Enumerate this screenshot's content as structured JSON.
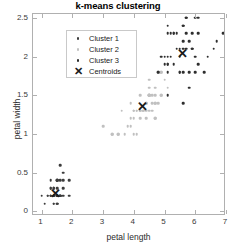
{
  "chart_data": {
    "type": "scatter",
    "title": "k-means clustering",
    "xlabel": "petal length",
    "ylabel": "petal width",
    "xlim": [
      0.72,
      7.0
    ],
    "ylim": [
      -0.06,
      2.55
    ],
    "xticks": [
      "1",
      "2",
      "3",
      "4",
      "5",
      "6",
      "7"
    ],
    "xtickvals": [
      1,
      2,
      3,
      4,
      5,
      6,
      7
    ],
    "yticks": [
      "0",
      "0.5",
      "1",
      "1.5",
      "2",
      "2.5"
    ],
    "ytickvals": [
      0,
      0.5,
      1,
      1.5,
      2,
      2.5
    ],
    "grid": false,
    "legend_position": "upper-left",
    "legend": [
      {
        "label": "Cluster 1",
        "marker": "dot",
        "color": "#3c3c3c"
      },
      {
        "label": "Cluster 2",
        "marker": "dot",
        "color": "#c0c0c0"
      },
      {
        "label": "Cluster 3",
        "marker": "dot",
        "color": "#2e2e2e"
      },
      {
        "label": "Centroids",
        "marker": "x",
        "color": "#1a1a1a"
      }
    ],
    "series": [
      {
        "name": "Cluster 1",
        "color": "#3c3c3c",
        "points": [
          [
            1.4,
            0.2
          ],
          [
            1.4,
            0.2
          ],
          [
            1.3,
            0.2
          ],
          [
            1.5,
            0.2
          ],
          [
            1.4,
            0.2
          ],
          [
            1.7,
            0.4
          ],
          [
            1.4,
            0.3
          ],
          [
            1.5,
            0.2
          ],
          [
            1.4,
            0.2
          ],
          [
            1.5,
            0.1
          ],
          [
            1.5,
            0.2
          ],
          [
            1.6,
            0.2
          ],
          [
            1.4,
            0.1
          ],
          [
            1.1,
            0.1
          ],
          [
            1.2,
            0.2
          ],
          [
            1.5,
            0.4
          ],
          [
            1.3,
            0.4
          ],
          [
            1.4,
            0.3
          ],
          [
            1.7,
            0.3
          ],
          [
            1.5,
            0.3
          ],
          [
            1.7,
            0.2
          ],
          [
            1.5,
            0.4
          ],
          [
            1.0,
            0.2
          ],
          [
            1.7,
            0.5
          ],
          [
            1.9,
            0.2
          ],
          [
            1.6,
            0.2
          ],
          [
            1.6,
            0.4
          ],
          [
            1.5,
            0.2
          ],
          [
            1.4,
            0.2
          ],
          [
            1.6,
            0.2
          ],
          [
            1.6,
            0.2
          ],
          [
            1.5,
            0.4
          ],
          [
            1.5,
            0.1
          ],
          [
            1.4,
            0.2
          ],
          [
            1.5,
            0.2
          ],
          [
            1.2,
            0.2
          ],
          [
            1.3,
            0.2
          ],
          [
            1.4,
            0.1
          ],
          [
            1.3,
            0.2
          ],
          [
            1.5,
            0.2
          ],
          [
            1.3,
            0.3
          ],
          [
            1.3,
            0.3
          ],
          [
            1.3,
            0.2
          ],
          [
            1.6,
            0.6
          ],
          [
            1.9,
            0.4
          ],
          [
            1.4,
            0.3
          ],
          [
            1.6,
            0.2
          ],
          [
            1.4,
            0.2
          ],
          [
            1.5,
            0.2
          ],
          [
            1.4,
            0.2
          ]
        ]
      },
      {
        "name": "Cluster 2",
        "color": "#c0c0c0",
        "points": [
          [
            4.7,
            1.4
          ],
          [
            4.5,
            1.5
          ],
          [
            4.9,
            1.5
          ],
          [
            4.0,
            1.3
          ],
          [
            4.6,
            1.5
          ],
          [
            4.5,
            1.3
          ],
          [
            4.7,
            1.6
          ],
          [
            3.3,
            1.0
          ],
          [
            4.6,
            1.3
          ],
          [
            3.9,
            1.4
          ],
          [
            3.5,
            1.0
          ],
          [
            4.2,
            1.5
          ],
          [
            4.0,
            1.0
          ],
          [
            4.7,
            1.4
          ],
          [
            3.6,
            1.3
          ],
          [
            4.4,
            1.4
          ],
          [
            4.5,
            1.5
          ],
          [
            4.1,
            1.0
          ],
          [
            4.5,
            1.5
          ],
          [
            3.9,
            1.1
          ],
          [
            4.8,
            1.8
          ],
          [
            4.0,
            1.3
          ],
          [
            4.9,
            1.5
          ],
          [
            4.7,
            1.2
          ],
          [
            4.3,
            1.3
          ],
          [
            4.4,
            1.4
          ],
          [
            4.8,
            1.4
          ],
          [
            5.0,
            1.7
          ],
          [
            4.5,
            1.5
          ],
          [
            3.5,
            1.0
          ],
          [
            3.8,
            1.1
          ],
          [
            3.7,
            1.0
          ],
          [
            3.9,
            1.2
          ],
          [
            5.1,
            1.6
          ],
          [
            4.5,
            1.5
          ],
          [
            4.5,
            1.6
          ],
          [
            4.7,
            1.5
          ],
          [
            4.4,
            1.3
          ],
          [
            4.1,
            1.3
          ],
          [
            4.0,
            1.3
          ],
          [
            4.4,
            1.2
          ],
          [
            4.6,
            1.4
          ],
          [
            4.0,
            1.2
          ],
          [
            3.3,
            1.0
          ],
          [
            4.2,
            1.3
          ],
          [
            4.2,
            1.2
          ],
          [
            4.2,
            1.3
          ],
          [
            4.3,
            1.3
          ],
          [
            3.0,
            1.1
          ],
          [
            4.1,
            1.3
          ],
          [
            4.5,
            1.7
          ],
          [
            4.9,
            1.8
          ],
          [
            4.8,
            1.8
          ],
          [
            4.9,
            1.8
          ],
          [
            4.7,
            1.2
          ]
        ]
      },
      {
        "name": "Cluster 3",
        "color": "#2e2e2e",
        "points": [
          [
            6.0,
            2.5
          ],
          [
            5.1,
            1.9
          ],
          [
            5.9,
            2.1
          ],
          [
            5.6,
            1.8
          ],
          [
            5.8,
            2.2
          ],
          [
            6.6,
            2.1
          ],
          [
            6.3,
            1.8
          ],
          [
            6.1,
            2.5
          ],
          [
            5.1,
            2.0
          ],
          [
            5.3,
            1.9
          ],
          [
            5.5,
            2.1
          ],
          [
            5.0,
            2.0
          ],
          [
            5.1,
            2.4
          ],
          [
            5.3,
            2.3
          ],
          [
            5.5,
            1.8
          ],
          [
            6.7,
            2.2
          ],
          [
            6.9,
            2.3
          ],
          [
            5.7,
            2.5
          ],
          [
            4.9,
            2.0
          ],
          [
            5.7,
            2.1
          ],
          [
            6.0,
            1.8
          ],
          [
            4.8,
            1.8
          ],
          [
            5.8,
            1.6
          ],
          [
            6.1,
            1.9
          ],
          [
            6.4,
            2.0
          ],
          [
            5.6,
            2.2
          ],
          [
            5.1,
            1.5
          ],
          [
            5.6,
            1.4
          ],
          [
            6.1,
            2.3
          ],
          [
            5.6,
            2.4
          ],
          [
            5.5,
            1.8
          ],
          [
            5.4,
            2.1
          ],
          [
            5.6,
            2.4
          ],
          [
            5.1,
            2.3
          ],
          [
            5.1,
            1.9
          ],
          [
            5.9,
            2.3
          ],
          [
            5.7,
            2.5
          ],
          [
            5.2,
            2.3
          ],
          [
            5.0,
            1.9
          ],
          [
            5.2,
            2.0
          ],
          [
            5.4,
            2.3
          ],
          [
            5.1,
            1.8
          ],
          [
            5.3,
            2.3
          ],
          [
            5.6,
            2.1
          ],
          [
            5.8,
            1.8
          ],
          [
            6.0,
            2.0
          ],
          [
            5.7,
            2.3
          ],
          [
            5.9,
            2.1
          ],
          [
            5.5,
            2.0
          ]
        ]
      }
    ],
    "centroids": {
      "name": "Centroids",
      "marker": "x",
      "color": "#1a1a1a",
      "points": [
        [
          1.46,
          0.24
        ],
        [
          4.29,
          1.36
        ],
        [
          5.6,
          2.05
        ]
      ]
    }
  }
}
